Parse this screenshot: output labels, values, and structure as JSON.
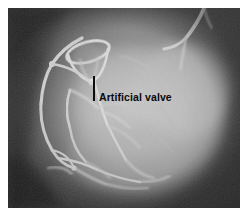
{
  "figure": {
    "kind": "cardiac-angiogram-radiograph",
    "annotation": {
      "label": "Artificial valve",
      "label_color": "#0a0a0a",
      "leader_line_color": "#0d0d0d"
    }
  },
  "palette": {
    "page_background": "#ffffff",
    "film_dark": "#3d3d3d",
    "film_mid": "#6e6e6e",
    "film_light": "#b9b9b9",
    "myocardium_bright": "#cfcfcf",
    "vessel_bright": "#e8e8e8",
    "prosthesis_bright": "#efefef",
    "background_shadow": "#2e2e2e"
  },
  "image_content": {
    "modality": "X-ray coronary angiogram",
    "structures": [
      "left ventricular silhouette",
      "opacified coronary arteries",
      "prosthetic ball-cage valve",
      "catheter entering from superior field"
    ]
  }
}
